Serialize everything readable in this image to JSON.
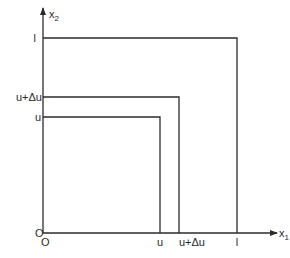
{
  "diagram": {
    "x_axis_label": "x",
    "x_axis_subscript": "1",
    "y_axis_label": "x",
    "y_axis_subscript": "2",
    "origin_label_x": "O",
    "origin_label_y": "O",
    "x_ticks": [
      "u",
      "u+Δu",
      "l"
    ],
    "y_ticks": [
      "l",
      "u+Δu",
      "u"
    ],
    "squares": [
      {
        "name": "square-u",
        "side": "u"
      },
      {
        "name": "square-u-plus-delta-u",
        "side": "u+Δu"
      },
      {
        "name": "square-l",
        "side": "l"
      }
    ],
    "line_color": "#2b2b2b"
  }
}
